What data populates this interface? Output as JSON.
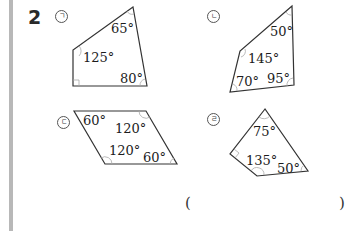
{
  "problem": {
    "number": "2"
  },
  "figures": [
    {
      "id": "a",
      "label": "ㄱ",
      "shape": "quadrilateral",
      "angles": [
        "65°",
        "125°",
        "80°"
      ],
      "right_angle_marked": true
    },
    {
      "id": "b",
      "label": "ㄴ",
      "shape": "quadrilateral",
      "angles": [
        "50°",
        "145°",
        "70°",
        "95°"
      ],
      "right_angle_marked": false
    },
    {
      "id": "c",
      "label": "ㄷ",
      "shape": "parallelogram",
      "angles": [
        "60°",
        "120°",
        "120°",
        "60°"
      ],
      "right_angle_marked": false
    },
    {
      "id": "d",
      "label": "ㄹ",
      "shape": "quadrilateral",
      "angles": [
        "75°",
        "135°",
        "50°"
      ],
      "right_angle_marked": true
    }
  ],
  "answer": {
    "open_paren": "(",
    "close_paren": ")",
    "value": ""
  }
}
